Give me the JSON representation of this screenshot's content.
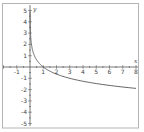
{
  "chart_data": {
    "type": "line",
    "title": "",
    "function": "y = log_{1/3}(x)",
    "xlabel": "x",
    "ylabel": "y",
    "xlim": [
      -2.2,
      8.2
    ],
    "ylim": [
      -5.2,
      5.2
    ],
    "x_ticks": [
      -1,
      1,
      2,
      3,
      4,
      5,
      6,
      7,
      8
    ],
    "y_ticks": [
      5,
      4,
      3,
      2,
      1,
      -1,
      -2,
      -3,
      -4,
      -5
    ],
    "x_tick_labels": [
      "-1",
      "1",
      "2",
      "3",
      "4",
      "5",
      "6",
      "7",
      "8"
    ],
    "y_tick_labels": [
      "5",
      "4",
      "3",
      "2",
      "1",
      "-1",
      "-2",
      "-3",
      "-4",
      "-5"
    ],
    "grid": false,
    "legend": null,
    "series": [
      {
        "name": "log_{1/3}(x)",
        "x": [
          0.0045,
          0.01,
          0.03,
          0.05,
          0.1,
          0.2,
          0.3,
          0.5,
          0.75,
          1,
          1.5,
          2,
          3,
          4,
          5,
          6,
          7,
          8
        ],
        "values": [
          4.92,
          4.19,
          3.19,
          2.73,
          2.1,
          1.46,
          1.1,
          0.63,
          0.26,
          0,
          -0.37,
          -0.63,
          -1.0,
          -1.26,
          -1.46,
          -1.63,
          -1.77,
          -1.89
        ]
      }
    ]
  },
  "colors": {
    "frame": "#b4b4b4",
    "axis": "#555555",
    "curve": "#555555",
    "text": "#444444",
    "background": "#ffffff"
  }
}
